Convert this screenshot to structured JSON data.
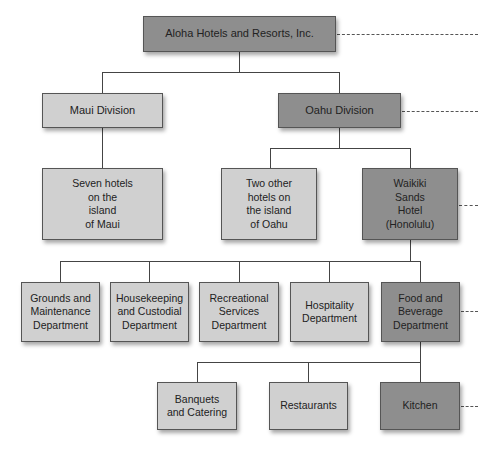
{
  "chart": {
    "type": "org-chart",
    "colors": {
      "highlight": "#8e8e8e",
      "normal": "#d0d0d0",
      "line": "#444444"
    },
    "levels": {
      "company": {
        "label": "Aloha Hotels and Resorts, Inc.",
        "highlighted": true
      },
      "divisions": [
        {
          "label": "Maui Division",
          "highlighted": false
        },
        {
          "label": "Oahu Division",
          "highlighted": true
        }
      ],
      "hotels": [
        {
          "label": "Seven hotels\non the\nisland\nof Maui",
          "highlighted": false
        },
        {
          "label": "Two other\nhotels on\nthe island\nof Oahu",
          "highlighted": false
        },
        {
          "label": "Waikiki\nSands\nHotel\n(Honolulu)",
          "highlighted": true
        }
      ],
      "departments": [
        {
          "label": "Grounds and\nMaintenance\nDepartment",
          "highlighted": false
        },
        {
          "label": "Housekeeping\nand Custodial\nDepartment",
          "highlighted": false
        },
        {
          "label": "Recreational\nServices\nDepartment",
          "highlighted": false
        },
        {
          "label": "Hospitality\nDepartment",
          "highlighted": false
        },
        {
          "label": "Food and\nBeverage\nDepartment",
          "highlighted": true
        }
      ],
      "units": [
        {
          "label": "Banquets\nand Catering",
          "highlighted": false
        },
        {
          "label": "Restaurants",
          "highlighted": false
        },
        {
          "label": "Kitchen",
          "highlighted": true
        }
      ]
    }
  }
}
